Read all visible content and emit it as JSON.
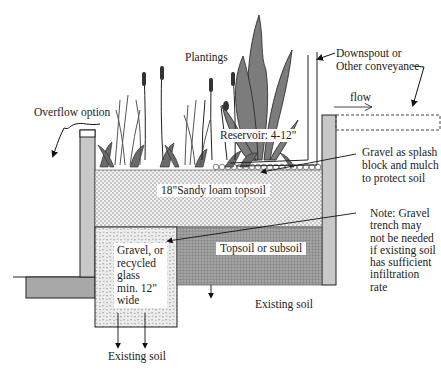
{
  "diagram": {
    "type": "rain-garden-cross-section",
    "colors": {
      "background": "#ffffff",
      "wall_fill": "#c8c8c8",
      "footing_fill": "#a8a8a8",
      "topsoil_fill": "#eeeeee",
      "gravel_fill": "#e6e6e6",
      "subsoil_fill": "#9a9a9a",
      "plant_dark": "#555555",
      "plant_mid": "#888888",
      "line": "#222222"
    },
    "labels": {
      "plantings": "Plantings",
      "downspout": [
        "Downspout or",
        "Other conveyance"
      ],
      "flow": "flow",
      "overflow": "Overflow option",
      "reservoir": "Reservoir: 4-12\"",
      "gravel_splash": [
        "Gravel as splash",
        "block and mulch",
        "to protect soil"
      ],
      "sandy_loam": "18\"Sandy loam topsoil",
      "gravel_trench": [
        "Gravel, or",
        "recycled",
        "glass",
        "min. 12\"",
        "wide"
      ],
      "topsoil_subsoil": "Topsoil or subsoil",
      "note": [
        "Note: Gravel",
        "trench may",
        "not be needed",
        "if existing soil",
        "has sufficient",
        "infiltration",
        "rate"
      ],
      "existing_soil_right": "Existing soil",
      "existing_soil_bottom": "Existing soil"
    }
  }
}
